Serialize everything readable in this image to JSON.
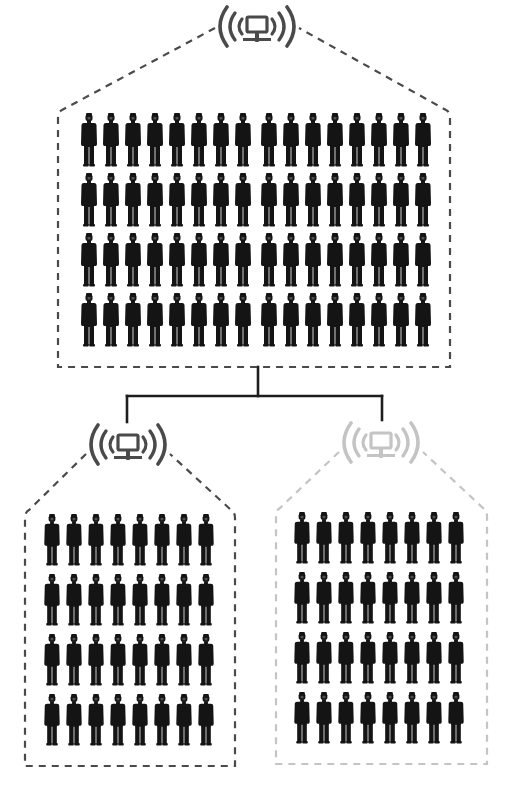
{
  "colors": {
    "background": "#ffffff",
    "active": "#4a4a4a",
    "inactive": "#c4c4c4",
    "person": "#141414",
    "connector": "#1e1e1e"
  },
  "nodes": [
    {
      "id": "root",
      "label": "Main network",
      "icon": "wireless-network-computer-icon",
      "state": "active",
      "icon_center": [
        257,
        28
      ],
      "box": {
        "x": 58,
        "y": 110,
        "w": 392,
        "h": 257,
        "apex_y": 30
      },
      "people": {
        "rows": 4,
        "cols": 16,
        "group_gap_after": 8,
        "x0": 80,
        "y0": 113,
        "pitch_x": 22,
        "pitch_y": 60,
        "w": 18,
        "h": 54
      },
      "count": 64
    },
    {
      "id": "left",
      "label": "Sub-network A",
      "icon": "wireless-network-computer-icon",
      "state": "active",
      "icon_center": [
        128,
        446
      ],
      "box": {
        "x": 25,
        "y": 510,
        "w": 210,
        "h": 256,
        "apex_y": 450
      },
      "people": {
        "rows": 4,
        "cols": 8,
        "group_gap_after": 0,
        "x0": 43,
        "y0": 514,
        "pitch_x": 22,
        "pitch_y": 60,
        "w": 18,
        "h": 52
      },
      "count": 32
    },
    {
      "id": "right",
      "label": "Sub-network B",
      "icon": "wireless-network-computer-icon",
      "state": "inactive",
      "icon_center": [
        381,
        444
      ],
      "box": {
        "x": 276,
        "y": 508,
        "w": 211,
        "h": 256,
        "apex_y": 448
      },
      "people": {
        "rows": 4,
        "cols": 8,
        "group_gap_after": 0,
        "x0": 293,
        "y0": 512,
        "pitch_x": 22,
        "pitch_y": 60,
        "w": 18,
        "h": 52
      },
      "count": 32
    }
  ],
  "connector": {
    "stem": {
      "x": 258,
      "y1": 367,
      "y2": 396
    },
    "bar": {
      "y": 396,
      "x1": 127,
      "x2": 382
    },
    "drops": [
      {
        "x": 127,
        "y2": 422
      },
      {
        "x": 382,
        "y2": 420
      }
    ]
  }
}
